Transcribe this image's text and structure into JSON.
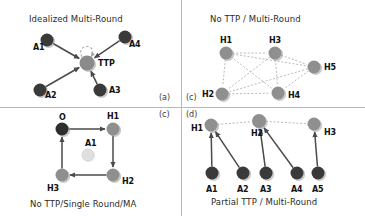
{
  "figure": {
    "width": 365,
    "height": 216,
    "background": "#ffffff",
    "node_colors": {
      "agent_dark": "#3a3a3a",
      "host_mid": "#8f8f8f",
      "ttp_mid": "#8a8a8a",
      "origin_dark": "#2e2e2e",
      "inactive_light": "#e0e0e0",
      "edge_solid": "#4a4a4a",
      "edge_dashed": "#a8a8a8",
      "divider": "#b9b9b9"
    }
  },
  "panels": [
    {
      "id": "panel-a",
      "tag": "(a)",
      "caption": "Idealized Multi-Round",
      "caption_position": "top",
      "nodes": [
        {
          "id": "A1",
          "label": "A1",
          "x": 47,
          "y": 40,
          "r": 6.5,
          "kind": "agent"
        },
        {
          "id": "A4",
          "label": "A4",
          "x": 125,
          "y": 37,
          "r": 6.5,
          "kind": "agent"
        },
        {
          "id": "A2",
          "label": "A2",
          "x": 40,
          "y": 90,
          "r": 6.5,
          "kind": "agent"
        },
        {
          "id": "A3",
          "label": "A3",
          "x": 100,
          "y": 90,
          "r": 6.5,
          "kind": "agent"
        },
        {
          "id": "TTP",
          "label": "TTP",
          "x": 87,
          "y": 63,
          "r": 7.5,
          "kind": "ttp"
        }
      ],
      "edges": [
        {
          "from": "A1",
          "to": "TTP",
          "style": "solid",
          "arrow": true
        },
        {
          "from": "A4",
          "to": "TTP",
          "style": "solid",
          "arrow": true
        },
        {
          "from": "A2",
          "to": "TTP",
          "style": "solid",
          "arrow": true
        },
        {
          "from": "A3",
          "to": "TTP",
          "style": "solid",
          "arrow": true
        },
        {
          "from": "TTP",
          "to": "TTP",
          "style": "dashed",
          "arrow": true,
          "self_loop": true
        }
      ]
    },
    {
      "id": "panel-c-top",
      "tag": "(c)",
      "caption": "No TTP / Multi-Round",
      "caption_position": "top",
      "nodes": [
        {
          "id": "H1",
          "label": "H1",
          "x": 226,
          "y": 53,
          "r": 6.5,
          "kind": "host"
        },
        {
          "id": "H3",
          "label": "H3",
          "x": 275,
          "y": 53,
          "r": 6.5,
          "kind": "host"
        },
        {
          "id": "H5",
          "label": "H5",
          "x": 314,
          "y": 67,
          "r": 6.5,
          "kind": "host"
        },
        {
          "id": "H2",
          "label": "H2",
          "x": 222,
          "y": 94,
          "r": 6.5,
          "kind": "host"
        },
        {
          "id": "H4",
          "label": "H4",
          "x": 278,
          "y": 93,
          "r": 6.5,
          "kind": "host"
        }
      ],
      "edges": [
        {
          "from": "H1",
          "to": "H3",
          "style": "dashed",
          "arrow": false
        },
        {
          "from": "H1",
          "to": "H5",
          "style": "dashed",
          "arrow": false
        },
        {
          "from": "H1",
          "to": "H2",
          "style": "dashed",
          "arrow": false
        },
        {
          "from": "H1",
          "to": "H4",
          "style": "dashed",
          "arrow": false
        },
        {
          "from": "H3",
          "to": "H5",
          "style": "dashed",
          "arrow": false
        },
        {
          "from": "H3",
          "to": "H2",
          "style": "dashed",
          "arrow": false
        },
        {
          "from": "H3",
          "to": "H4",
          "style": "dashed",
          "arrow": false
        },
        {
          "from": "H5",
          "to": "H2",
          "style": "dashed",
          "arrow": false
        },
        {
          "from": "H5",
          "to": "H4",
          "style": "dashed",
          "arrow": false
        },
        {
          "from": "H2",
          "to": "H4",
          "style": "dashed",
          "arrow": false
        }
      ]
    },
    {
      "id": "panel-c-bottom",
      "tag": "(c)",
      "caption": "No TTP/Single Round/MA",
      "caption_position": "bottom",
      "nodes": [
        {
          "id": "O",
          "label": "O",
          "x": 62,
          "y": 129,
          "r": 6.5,
          "kind": "origin"
        },
        {
          "id": "H1",
          "label": "H1",
          "x": 113,
          "y": 129,
          "r": 6.5,
          "kind": "host"
        },
        {
          "id": "H2",
          "label": "H2",
          "x": 113,
          "y": 175,
          "r": 6.5,
          "kind": "host"
        },
        {
          "id": "H3",
          "label": "H3",
          "x": 62,
          "y": 175,
          "r": 6.5,
          "kind": "host"
        },
        {
          "id": "A1",
          "label": "A1",
          "x": 88,
          "y": 155,
          "r": 6.0,
          "kind": "inactive"
        }
      ],
      "edges": [
        {
          "from": "O",
          "to": "H1",
          "style": "solid",
          "arrow": true
        },
        {
          "from": "H1",
          "to": "H2",
          "style": "solid",
          "arrow": true
        },
        {
          "from": "H2",
          "to": "H3",
          "style": "solid",
          "arrow": true
        },
        {
          "from": "H3",
          "to": "O",
          "style": "solid",
          "arrow": true
        }
      ]
    },
    {
      "id": "panel-d",
      "tag": "(d)",
      "caption": "Partial TTP / Multi-Round",
      "caption_position": "bottom",
      "nodes": [
        {
          "id": "H1",
          "label": "H1",
          "x": 211,
          "y": 125,
          "r": 6.5,
          "kind": "host"
        },
        {
          "id": "H2",
          "label": "H2",
          "x": 259,
          "y": 121,
          "r": 7.0,
          "kind": "host"
        },
        {
          "id": "H3",
          "label": "H3",
          "x": 314,
          "y": 124,
          "r": 6.5,
          "kind": "host"
        },
        {
          "id": "A1",
          "label": "A1",
          "x": 212,
          "y": 173,
          "r": 6.5,
          "kind": "agent"
        },
        {
          "id": "A2",
          "label": "A2",
          "x": 243,
          "y": 173,
          "r": 6.5,
          "kind": "agent"
        },
        {
          "id": "A3",
          "label": "A3",
          "x": 266,
          "y": 173,
          "r": 6.5,
          "kind": "agent"
        },
        {
          "id": "A4",
          "label": "A4",
          "x": 297,
          "y": 173,
          "r": 6.5,
          "kind": "agent"
        },
        {
          "id": "A5",
          "label": "A5",
          "x": 318,
          "y": 173,
          "r": 6.5,
          "kind": "agent"
        }
      ],
      "edges": [
        {
          "from": "H1",
          "to": "H2",
          "style": "dashed",
          "arrow": false
        },
        {
          "from": "H2",
          "to": "H3",
          "style": "dashed",
          "arrow": false
        },
        {
          "from": "A1",
          "to": "H1",
          "style": "solid",
          "arrow": true
        },
        {
          "from": "A2",
          "to": "H1",
          "style": "solid",
          "arrow": true
        },
        {
          "from": "A3",
          "to": "H2",
          "style": "solid",
          "arrow": true
        },
        {
          "from": "A4",
          "to": "H2",
          "style": "solid",
          "arrow": true
        },
        {
          "from": "A5",
          "to": "H3",
          "style": "solid",
          "arrow": true
        }
      ]
    }
  ],
  "labels": {
    "panel_a_caption": "Idealized Multi-Round",
    "panel_c_top_caption": "No TTP / Multi-Round",
    "panel_c_bottom_caption": "No TTP/Single Round/MA",
    "panel_d_caption": "Partial TTP / Multi-Round",
    "tag_a": "(a)",
    "tag_c_top": "(c)",
    "tag_c_bottom": "(c)",
    "tag_d": "(d)"
  }
}
